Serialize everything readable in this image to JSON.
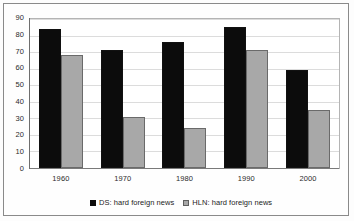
{
  "chart_data": {
    "type": "bar",
    "title": "",
    "subtitle": "",
    "xlabel": "",
    "ylabel": "",
    "categories": [
      "1960",
      "1970",
      "1980",
      "1990",
      "2000"
    ],
    "series": [
      {
        "name": "DS: hard foreign news",
        "key": "ds",
        "color": "#0c0c0c",
        "values": [
          84,
          71,
          76,
          85,
          59
        ]
      },
      {
        "name": "HLN: hard foreign news",
        "key": "hln",
        "color": "#a8a8a8",
        "values": [
          68,
          31,
          24,
          71,
          35
        ]
      }
    ],
    "ylim": [
      0,
      90
    ],
    "yticks": [
      0,
      10,
      20,
      30,
      40,
      50,
      60,
      70,
      80,
      90
    ],
    "ytick_labels": [
      "0",
      "10",
      "20",
      "30",
      "40",
      "50",
      "60",
      "70",
      "80",
      "90"
    ],
    "grid": true,
    "grid_axis": "y",
    "legend_position": "bottom",
    "legend": [
      {
        "label": "DS: hard foreign news",
        "swatch": "ds"
      },
      {
        "label": "HLN: hard foreign news",
        "swatch": "hln"
      }
    ]
  },
  "frame": {
    "border_color": "#8a8a8a",
    "plot_border_color": "#b4b4b4",
    "background": "#ffffff"
  }
}
